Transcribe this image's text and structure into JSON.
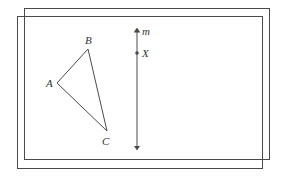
{
  "diagram": {
    "back_rect": {
      "x": 24,
      "y": 8,
      "w": 245,
      "h": 151
    },
    "front_rect": {
      "x": 17,
      "y": 16,
      "w": 245,
      "h": 152
    },
    "triangle": {
      "vertices": {
        "A": {
          "x": 57,
          "y": 83
        },
        "B": {
          "x": 88,
          "y": 49
        },
        "C": {
          "x": 107,
          "y": 131
        }
      },
      "labels": {
        "A": "A",
        "B": "B",
        "C": "C"
      }
    },
    "line_m": {
      "x": 137,
      "y_top": 27,
      "y_bottom": 151,
      "label": "m"
    },
    "point_X": {
      "x": 137,
      "y": 53,
      "label": "X"
    },
    "line_color": "#4a4a4a"
  }
}
